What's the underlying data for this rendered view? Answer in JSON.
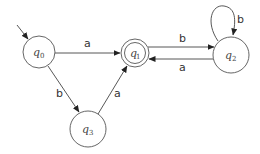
{
  "diagram": {
    "type": "finite-automaton",
    "states": [
      {
        "id": "q0",
        "label": "q",
        "sub": "0",
        "cx": 39,
        "cy": 52,
        "r": 16,
        "accepting": false,
        "initial": true
      },
      {
        "id": "q1",
        "label": "q",
        "sub": "1",
        "cx": 135,
        "cy": 53,
        "r": 14,
        "accepting": true,
        "initial": false
      },
      {
        "id": "q2",
        "label": "q",
        "sub": "2",
        "cx": 231,
        "cy": 54,
        "r": 18,
        "accepting": false,
        "initial": false
      },
      {
        "id": "q3",
        "label": "q",
        "sub": "3",
        "cx": 88,
        "cy": 129,
        "r": 18,
        "accepting": false,
        "initial": false
      }
    ],
    "transitions": [
      {
        "from": "q0",
        "to": "q1",
        "symbol": "a"
      },
      {
        "from": "q1",
        "to": "q2",
        "symbol": "b"
      },
      {
        "from": "q2",
        "to": "q1",
        "symbol": "a"
      },
      {
        "from": "q2",
        "to": "q2",
        "symbol": "b"
      },
      {
        "from": "q0",
        "to": "q3",
        "symbol": "b"
      },
      {
        "from": "q3",
        "to": "q1",
        "symbol": "a"
      }
    ],
    "labels": {
      "q0": "q",
      "q0_sub": "0",
      "q1": "q",
      "q1_sub": "1",
      "q2": "q",
      "q2_sub": "2",
      "q3": "q",
      "q3_sub": "3",
      "e_q0_q1": "a",
      "e_q1_q2": "b",
      "e_q2_q1": "a",
      "e_q2_q2": "b",
      "e_q0_q3": "b",
      "e_q3_q1": "a"
    }
  }
}
